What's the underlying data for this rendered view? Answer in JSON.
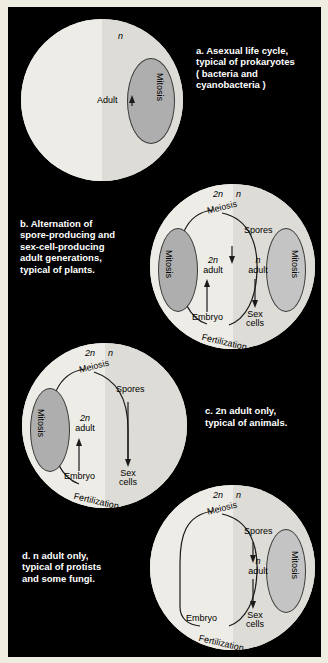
{
  "figure": {
    "background_color": "#000000",
    "page_color": "#efece1",
    "panels": [
      {
        "id": "a",
        "caption": "a. Asexual life cycle,\ntypical of prokaryotes\n( bacteria and\ncyanobacteria )",
        "ploidy_top": "n",
        "labels": {
          "adult": "Adult",
          "mitosis_right": "Mitosis"
        },
        "has_left_mitosis": false,
        "has_right_mitosis": true
      },
      {
        "id": "b",
        "caption": "b. Alternation of\nspore-producing and\nsex-cell-producing\nadult generations,\ntypical of plants.",
        "ploidy_left": "2n",
        "ploidy_right": "n",
        "labels": {
          "meiosis": "Meiosis",
          "spores": "Spores",
          "mitosis_left": "Mitosis",
          "mitosis_right": "Mitosis",
          "adult_2n_ploidy": "2n",
          "adult_2n_word": "adult",
          "adult_n_ploidy": "n",
          "adult_n_word": "adult",
          "embryo": "Embryo",
          "sex_cells_1": "Sex",
          "sex_cells_2": "cells",
          "fertilization": "Fertilization"
        },
        "has_left_mitosis": true,
        "has_right_mitosis": true
      },
      {
        "id": "c",
        "caption": "c. 2n adult only,\ntypical of animals.",
        "caption_italic_token": "2n",
        "ploidy_left": "2n",
        "ploidy_right": "n",
        "labels": {
          "meiosis": "Meiosis",
          "spores": "Spores",
          "mitosis_left": "Mitosis",
          "adult_2n_ploidy": "2n",
          "adult_2n_word": "adult",
          "embryo": "Embryo",
          "sex_cells_1": "Sex",
          "sex_cells_2": "cells",
          "fertilization": "Fertilization"
        },
        "has_left_mitosis": true,
        "has_right_mitosis": false
      },
      {
        "id": "d",
        "caption": "d. n adult only,\ntypical of protists\nand some fungi.",
        "caption_italic_token": "n",
        "ploidy_left": "2n",
        "ploidy_right": "n",
        "labels": {
          "meiosis": "Meiosis",
          "spores": "Spores",
          "mitosis_right": "Mitosis",
          "adult_n_ploidy": "n",
          "adult_n_word": "adult",
          "embryo": "Embryo",
          "sex_cells_1": "Sex",
          "sex_cells_2": "cells",
          "fertilization": "Fertilization"
        },
        "has_left_mitosis": false,
        "has_right_mitosis": true
      }
    ],
    "colors": {
      "circle_light": "#eeece6",
      "circle_shade": "#dedcd6",
      "ellipse_fill": "#aeaeae",
      "caption_text": "#ffffff",
      "diagram_text": "#000000"
    }
  }
}
